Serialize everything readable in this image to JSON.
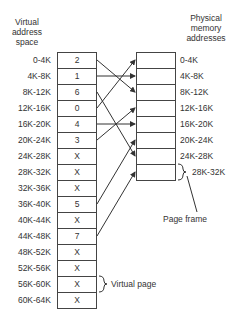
{
  "virtual": {
    "header": [
      "Virtual",
      "address",
      "space"
    ],
    "labels": [
      "0-4K",
      "4K-8K",
      "8K-12K",
      "12K-16K",
      "16K-20K",
      "20K-24K",
      "24K-28K",
      "28K-32K",
      "32K-36K",
      "36K-40K",
      "40K-44K",
      "44K-48K",
      "48K-52K",
      "52K-56K",
      "56K-60K",
      "60K-64K"
    ],
    "entries": [
      "2",
      "1",
      "6",
      "0",
      "4",
      "3",
      "X",
      "X",
      "X",
      "5",
      "X",
      "7",
      "X",
      "X",
      "X",
      "X"
    ]
  },
  "physical": {
    "header": [
      "Physical",
      "memory",
      "addresses"
    ],
    "labels": [
      "0-4K",
      "4K-8K",
      "8K-12K",
      "12K-16K",
      "16K-20K",
      "20K-24K",
      "24K-28K"
    ],
    "last_label": "28K-32K"
  },
  "annotations": {
    "page_frame": "Page frame",
    "virtual_page": "Virtual page"
  },
  "mappings": [
    {
      "virtual": 0,
      "physical": 2
    },
    {
      "virtual": 1,
      "physical": 1
    },
    {
      "virtual": 2,
      "physical": 6
    },
    {
      "virtual": 3,
      "physical": 0
    },
    {
      "virtual": 4,
      "physical": 4
    },
    {
      "virtual": 5,
      "physical": 3
    },
    {
      "virtual": 9,
      "physical": 5
    },
    {
      "virtual": 11,
      "physical": 7
    }
  ]
}
